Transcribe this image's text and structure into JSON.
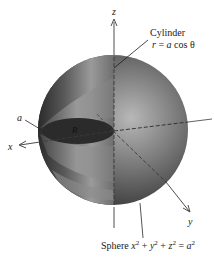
{
  "figure": {
    "axes": {
      "x_label": "x",
      "y_label": "y",
      "z_label": "z"
    },
    "labels": {
      "radius_label": "a",
      "region_label": "R",
      "cylinder_title": "Cylinder",
      "cylinder_eq_r": "r",
      "cylinder_eq_rest": " = ",
      "cylinder_eq_a": "a",
      "cylinder_eq_cos": " cos θ",
      "sphere_title": "Sphere ",
      "sphere_eq": {
        "x": "x",
        "x_exp": "2",
        "plus1": " + ",
        "y": "y",
        "y_exp": "2",
        "plus2": " + ",
        "z": "z",
        "z_exp": "2",
        "eq": " = ",
        "a": "a",
        "a_exp": "2"
      }
    },
    "colors": {
      "background": "#ffffff",
      "sphere_dark": "#2e2e2e",
      "sphere_mid": "#6a6a6a",
      "sphere_light": "#b4b4b4",
      "cylinder_band": "#8a8a8a",
      "disk": "#2a2a2a",
      "axis": "#3a3a3a",
      "text": "#1a1a1a"
    }
  }
}
